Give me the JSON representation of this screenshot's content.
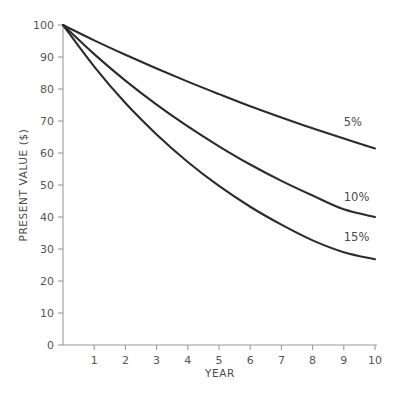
{
  "chart_data": {
    "type": "line",
    "title": "",
    "xlabel": "YEAR",
    "ylabel": "PRESENT VALUE ($)",
    "xlim": [
      0,
      10
    ],
    "ylim": [
      0,
      100
    ],
    "grid": false,
    "legend_position": "inline-right",
    "x_ticks": [
      "1",
      "2",
      "3",
      "4",
      "5",
      "6",
      "7",
      "8",
      "9",
      "10"
    ],
    "x_tick_values": [
      1,
      2,
      3,
      4,
      5,
      6,
      7,
      8,
      9,
      10
    ],
    "y_ticks": [
      "0",
      "10",
      "20",
      "30",
      "40",
      "50",
      "60",
      "70",
      "80",
      "90",
      "100"
    ],
    "y_tick_values": [
      0,
      10,
      20,
      30,
      40,
      50,
      60,
      70,
      80,
      90,
      100
    ],
    "x": [
      0,
      1,
      2,
      3,
      4,
      5,
      6,
      7,
      8,
      9,
      10
    ],
    "line_color": "#2b2b2b",
    "axis_color": "#9a9a9a",
    "series": [
      {
        "name": "5%",
        "label": "5%",
        "rate_percent": 5,
        "values": [
          100,
          95.2,
          90.7,
          86.4,
          82.3,
          78.4,
          74.6,
          71.1,
          67.7,
          64.5,
          61.4
        ]
      },
      {
        "name": "10%",
        "label": "10%",
        "rate_percent": 10,
        "values": [
          100,
          90.9,
          82.6,
          75.1,
          68.3,
          62.1,
          56.4,
          51.3,
          46.7,
          42.4,
          40.0
        ]
      },
      {
        "name": "15%",
        "label": "15%",
        "rate_percent": 15,
        "values": [
          100,
          87.0,
          75.6,
          65.8,
          57.2,
          49.7,
          43.2,
          37.6,
          32.7,
          29.0,
          26.8
        ]
      }
    ],
    "annotations": [
      {
        "text": "5%",
        "x": 9.0,
        "y": 68.5
      },
      {
        "text": "10%",
        "x": 9.0,
        "y": 45.0
      },
      {
        "text": "15%",
        "x": 9.0,
        "y": 32.5
      }
    ]
  }
}
